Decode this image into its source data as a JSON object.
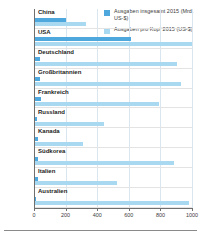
{
  "legend": {
    "items": [
      {
        "label": "Ausgaben insgesamt 2015 (Mrd. US-$)",
        "color": "#4ea7dd",
        "name": "total"
      },
      {
        "label": "Ausgaben pro Kopf 2015 (US-$)",
        "color": "#a9d9f1",
        "name": "per-capita"
      }
    ]
  },
  "chart_data": {
    "type": "bar",
    "orientation": "horizontal",
    "title": "",
    "xlabel": "",
    "ylabel": "",
    "xlim": [
      0,
      1000
    ],
    "xticks": [
      0,
      200,
      400,
      600,
      800,
      1000
    ],
    "grid": true,
    "legend_position": "top-right",
    "categories": [
      "China",
      "USA",
      "Deutschland",
      "Großbritannien",
      "Frankreich",
      "Russland",
      "Kanada",
      "Südkorea",
      "Italien",
      "Australien"
    ],
    "series": [
      {
        "name": "Ausgaben insgesamt 2015 (Mrd. US-$)",
        "color": "#4ea7dd",
        "values": [
          200,
          615,
          41,
          41,
          43,
          22,
          24,
          28,
          23,
          13
        ]
      },
      {
        "name": "Ausgaben pro Kopf 2015 (US-$)",
        "color": "#a9d9f1",
        "values": [
          330,
          1090,
          905,
          930,
          790,
          440,
          310,
          885,
          525,
          980
        ]
      }
    ]
  }
}
